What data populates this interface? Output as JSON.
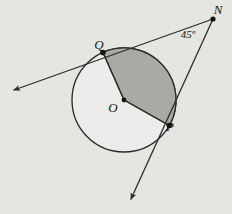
{
  "figure": {
    "background_color": "#ededeb",
    "ink_color": "#2b2b28",
    "shaded_sector_color": "#a9a9a6",
    "circle_fill_color": "#ececeb",
    "labels": {
      "center": "O",
      "tangent_point_upper": "Q",
      "tangent_point_lower": "P",
      "external_vertex": "N",
      "angle": "45º"
    },
    "geometry": {
      "circle": {
        "cx": 124,
        "cy": 100,
        "r": 52
      },
      "points": {
        "O": {
          "x": 124,
          "y": 100
        },
        "Q": {
          "x": 105,
          "y": 57
        },
        "P": {
          "x": 163,
          "y": 122
        },
        "N": {
          "x": 213,
          "y": 19
        }
      },
      "arrow_ends": {
        "tangent_q_far": {
          "x": 14,
          "y": 90
        },
        "tangent_p_far": {
          "x": 131,
          "y": 199
        }
      },
      "label_positions": {
        "O": {
          "x": 113,
          "y": 112
        },
        "Q": {
          "x": 99,
          "y": 49
        },
        "P": {
          "x": 170,
          "y": 131
        },
        "N": {
          "x": 218,
          "y": 14
        },
        "angle": {
          "x": 188,
          "y": 38
        }
      },
      "angle_degrees": 45
    },
    "bleed_text": [
      {
        "text": "a partir de la figura",
        "x": 16,
        "y": 16
      },
      {
        "text": "obtener el valor de",
        "x": 8,
        "y": 34
      },
      {
        "text": "que el arco",
        "x": 18,
        "y": 56
      },
      {
        "text": "calcular la medida",
        "x": 8,
        "y": 86
      },
      {
        "text": "angulo",
        "x": 22,
        "y": 112
      },
      {
        "text": "si la recta es tangente",
        "x": 6,
        "y": 138
      },
      {
        "text": "en el punto indicado",
        "x": 12,
        "y": 162
      },
      {
        "text": "resolver",
        "x": 20,
        "y": 188
      }
    ]
  }
}
